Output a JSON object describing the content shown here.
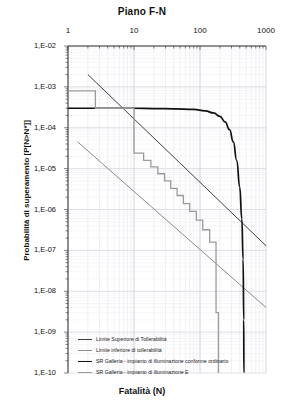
{
  "chart_data": {
    "type": "line",
    "title": "Piano F-N",
    "xlabel": "Fatalità (N)",
    "ylabel": "Probabilità di superamento [P[N>N*]]",
    "xscale": "log",
    "yscale": "log",
    "xlim": [
      1,
      1000
    ],
    "ylim": [
      1e-10,
      0.01
    ],
    "grid": true,
    "xticks": [
      {
        "value": 1,
        "label": "1"
      },
      {
        "value": 10,
        "label": "10"
      },
      {
        "value": 100,
        "label": "100"
      },
      {
        "value": 1000,
        "label": "1000"
      }
    ],
    "yticks": [
      {
        "value": 0.01,
        "label": "1,E-02"
      },
      {
        "value": 0.001,
        "label": "1,E-03"
      },
      {
        "value": 0.0001,
        "label": "1,E-04"
      },
      {
        "value": 1e-05,
        "label": "1,E-05"
      },
      {
        "value": 1e-06,
        "label": "1,E-06"
      },
      {
        "value": 1e-07,
        "label": "1,E-07"
      },
      {
        "value": 1e-08,
        "label": "1,E-08"
      },
      {
        "value": 1e-09,
        "label": "1,E-09"
      },
      {
        "value": 1e-10,
        "label": "1,E-10"
      }
    ],
    "legend_position": "bottom-left-inside",
    "series": [
      {
        "name": "Limite Superiore di Tollerabilità",
        "color": "#3f3f3f",
        "width": 1.0,
        "style": "straight-log-line",
        "points": [
          [
            2.0,
            0.002
          ],
          [
            1000.0,
            1.3e-07
          ]
        ]
      },
      {
        "name": "Limite inferiore di tollerabilità",
        "color": "#8a8a8a",
        "width": 1.0,
        "style": "straight-log-line",
        "points": [
          [
            1.4,
            4.5e-05
          ],
          [
            1000.0,
            4e-09
          ]
        ]
      },
      {
        "name": "SR Galleria - impianto di illuminazione conforme ordinario",
        "color": "#111111",
        "width": 1.7,
        "style": "smooth-curve",
        "points": [
          [
            1.0,
            0.0003
          ],
          [
            2.0,
            0.0003
          ],
          [
            5.0,
            0.0003
          ],
          [
            10.0,
            0.0003
          ],
          [
            20.0,
            0.000295
          ],
          [
            40.0,
            0.00029
          ],
          [
            80.0,
            0.00028
          ],
          [
            120.0,
            0.00026
          ],
          [
            160.0,
            0.00023
          ],
          [
            200.0,
            0.00019
          ],
          [
            240.0,
            0.00014
          ],
          [
            280.0,
            9e-05
          ],
          [
            320.0,
            4.5e-05
          ],
          [
            360.0,
            1.6e-05
          ],
          [
            400.0,
            3.5e-06
          ],
          [
            430.0,
            6e-07
          ],
          [
            450.0,
            6e-08
          ],
          [
            460.0,
            2e-09
          ],
          [
            462.0,
            1e-10
          ]
        ]
      },
      {
        "name": "SR Galleria - impianto di illuminazione E",
        "color": "#9a9a9a",
        "width": 1.3,
        "style": "staircase",
        "points": [
          [
            1.0,
            0.0008
          ],
          [
            2.6,
            0.0008
          ],
          [
            2.6,
            0.0003
          ],
          [
            10.0,
            0.0003
          ],
          [
            10.0,
            2.4e-05
          ],
          [
            14.0,
            2.4e-05
          ],
          [
            14.0,
            1.6e-05
          ],
          [
            18.0,
            1.6e-05
          ],
          [
            18.0,
            1.1e-05
          ],
          [
            23.0,
            1.1e-05
          ],
          [
            23.0,
            7.5e-06
          ],
          [
            29.0,
            7.5e-06
          ],
          [
            29.0,
            5e-06
          ],
          [
            36.0,
            5e-06
          ],
          [
            36.0,
            3.3e-06
          ],
          [
            45.0,
            3.3e-06
          ],
          [
            45.0,
            2.2e-06
          ],
          [
            56.0,
            2.2e-06
          ],
          [
            56.0,
            1.4e-06
          ],
          [
            70.0,
            1.4e-06
          ],
          [
            70.0,
            9e-07
          ],
          [
            88.0,
            9e-07
          ],
          [
            88.0,
            5.5e-07
          ],
          [
            110.0,
            5.5e-07
          ],
          [
            110.0,
            3.2e-07
          ],
          [
            140.0,
            3.2e-07
          ],
          [
            140.0,
            1.6e-07
          ],
          [
            175.0,
            1.6e-07
          ],
          [
            175.0,
            3e-09
          ],
          [
            190.0,
            3e-09
          ],
          [
            190.0,
            1e-10
          ]
        ]
      }
    ]
  },
  "legend": {
    "items": [
      {
        "label": "Limite Superiore di Tollerabilità"
      },
      {
        "label": "Limite inferiore di tollerabilità"
      },
      {
        "label": "SR Galleria - impianto di illuminazione conforme ordinario"
      },
      {
        "label": "SR Galleria - impianto di illuminazione E"
      }
    ]
  }
}
